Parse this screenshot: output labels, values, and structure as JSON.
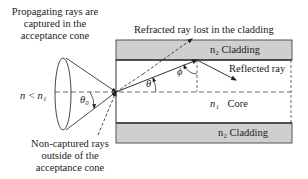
{
  "diagram": {
    "labels": {
      "captured": [
        "Propagating rays are",
        "captured in the",
        "acceptance cone"
      ],
      "refracted": "Refracted ray lost in the cladding",
      "reflected": "Reflected ray",
      "noncaptured": [
        "Non-captured rays",
        "outside of the",
        "acceptance cone"
      ],
      "top_cladding": "n₂ Cladding",
      "bottom_cladding": "n₂ Cladding",
      "core_index": "n₁",
      "core": "Core",
      "outside_index": "n < n₁",
      "theta0": "θ₀",
      "theta": "θ",
      "phi": "ϕ"
    },
    "colors": {
      "cladding_fill": "#cfcfcf",
      "cladding_stroke": "#555555",
      "line": "#222222",
      "text": "#222222"
    }
  }
}
